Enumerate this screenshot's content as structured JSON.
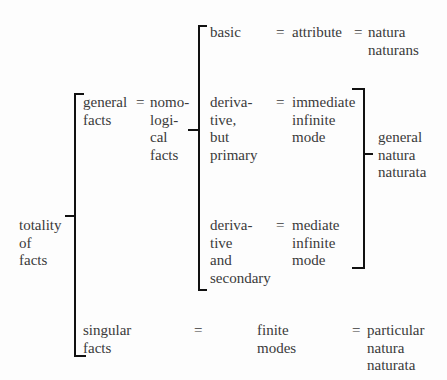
{
  "root": "totality\nof\nfacts",
  "general": {
    "term": "general\nfacts",
    "eq": "=",
    "equiv": "nomo-\nlogi-\ncal\nfacts"
  },
  "basic": {
    "term": "basic",
    "eq1": "=",
    "equiv": "attribute",
    "eq2": "=",
    "result": "natura\nnaturans"
  },
  "derivative_primary": {
    "term": "deriva-\ntive,\nbut\nprimary",
    "eq": "=",
    "equiv": "immediate\ninfinite\nmode"
  },
  "derivative_secondary": {
    "term": "deriva-\ntive\nand\nsecondary",
    "eq": "=",
    "equiv": "mediate\ninfinite\nmode"
  },
  "general_result": "general\nnatura\nnaturata",
  "singular": {
    "term": "singular\nfacts",
    "eq1": "=",
    "equiv": "finite\nmodes",
    "eq2": "=",
    "result": "particular\nnatura\nnaturata"
  }
}
